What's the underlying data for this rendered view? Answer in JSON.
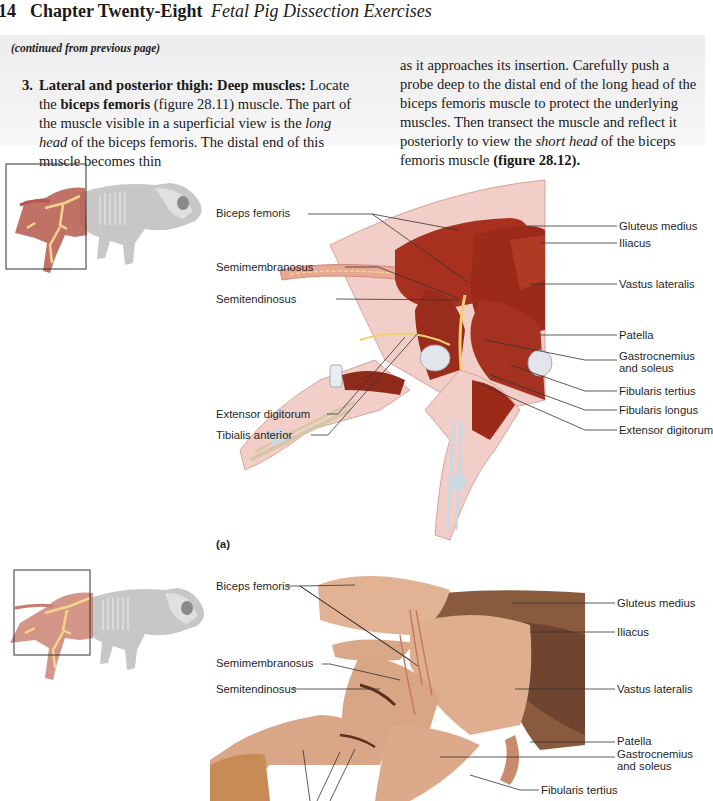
{
  "header": {
    "page_number": "14",
    "chapter": "Chapter Twenty-Eight",
    "subtitle": "Fetal Pig Dissection Exercises"
  },
  "instructions": {
    "continued_note": "(continued from previous page)",
    "step_number": "3.",
    "step_heading": "Lateral and posterior thigh: Deep muscles:",
    "left_text_1": " Locate the ",
    "left_bold_1": "biceps femoris",
    "left_text_2": " (figure 28.11) muscle. The part of the muscle visible in a superficial view is the ",
    "left_italic_1": "long head",
    "left_text_3": " of the biceps femoris. The distal end of this muscle becomes thin",
    "right_text_1": "as it approaches its insertion. Carefully push a probe deep to the distal end of the long head of the biceps femoris muscle to protect the underlying muscles. Then transect the muscle and reflect it posteriorly to view the ",
    "right_italic_1": "short head",
    "right_text_2": " of the biceps femoris muscle ",
    "right_bold_1": "(figure 28.12)."
  },
  "figure_a": {
    "panel_label": "(a)",
    "left_labels": [
      "Biceps femoris",
      "Semimembranosus",
      "Semitendinosus",
      "Extensor digitorum",
      "Tibialis anterior"
    ],
    "right_labels": [
      "Gluteus medius",
      "Iliacus",
      "Vastus lateralis",
      "Patella",
      "Gastrocnemius",
      "and soleus",
      "Fibularis tertius",
      "Fibularis longus",
      "Extensor digitorum"
    ]
  },
  "figure_b": {
    "left_labels": [
      "Biceps femoris",
      "Semimembranosus",
      "Semitendinosus"
    ],
    "right_labels": [
      "Gluteus medius",
      "Iliacus",
      "Vastus lateralis",
      "Patella",
      "Gastrocnemius",
      "and soleus",
      "Fibularis tertius"
    ]
  },
  "colors": {
    "muscle": "#a8301e",
    "muscle_dark": "#7d1f12",
    "skin": "#f1cfc8",
    "skin_outline": "#d9a39a",
    "nerve": "#f0d070",
    "bone": "#f4e6c4",
    "photo_tissue": "#d9a889",
    "photo_dark": "#8a5a3f",
    "band": "#efefef"
  }
}
